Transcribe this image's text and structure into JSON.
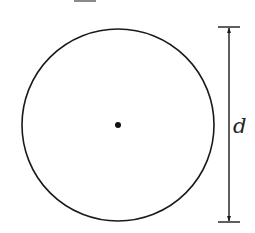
{
  "diagram": {
    "type": "circle-diameter",
    "label": "d",
    "colors": {
      "stroke": "#1a1a1a",
      "background": "#ffffff",
      "top_bar": "#8a8a8a"
    },
    "circle": {
      "cx": 118,
      "cy": 125,
      "r": 96
    },
    "center_dot": {
      "cx": 118,
      "cy": 125,
      "r": 3
    },
    "dimension": {
      "x": 229,
      "y_top": 27,
      "y_bottom": 222,
      "tick_half_width": 11
    }
  }
}
